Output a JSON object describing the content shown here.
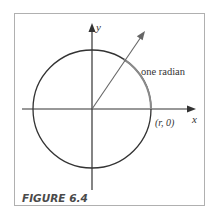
{
  "figure": {
    "caption": "FIGURE 6.4",
    "labels": {
      "y_axis": "y",
      "x_axis": "x",
      "arc": "one radian",
      "point": "(r, 0)"
    },
    "colors": {
      "frame": "#b0b0b0",
      "axes": "#333333",
      "circle": "#333333",
      "arc_highlight": "#8a8a8a",
      "ray": "#666666"
    },
    "geometry": {
      "center": [
        92,
        109
      ],
      "radius": 59,
      "angle_radians": 1
    }
  }
}
